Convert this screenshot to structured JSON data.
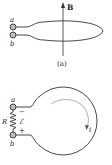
{
  "figure_a": {
    "terminal_top_label": "a",
    "terminal_bottom_label": "b",
    "field_label": "B",
    "caption": "(a)"
  },
  "figure_b": {
    "terminal_top_label": "a",
    "terminal_bottom_label": "b",
    "resistor_label": "R",
    "emf_label": "ℰ",
    "minus_sign": "−",
    "plus_sign": "+",
    "current_label": "i"
  },
  "colors": {
    "line": "#333333",
    "terminal_fill": "#bdbdbd",
    "arrow_inner": "#999999"
  }
}
